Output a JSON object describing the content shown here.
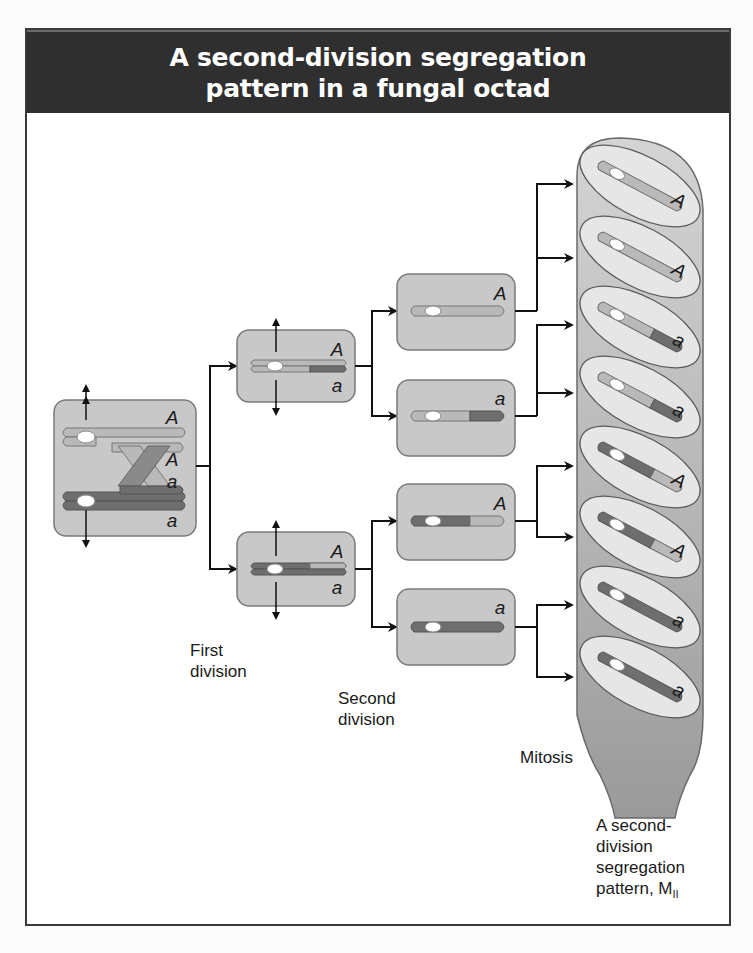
{
  "title": {
    "line1": "A second-division segregation",
    "line2": "pattern in a fungal octad"
  },
  "labels": {
    "first_division": [
      "First",
      "division"
    ],
    "second_division": [
      "Second",
      "division"
    ],
    "mitosis": "Mitosis",
    "result": [
      "A second-",
      "division",
      "segregation",
      "pattern, M"
    ],
    "result_subscript": "II"
  },
  "colors": {
    "title_bg": "#2f2f2f",
    "cell_fill": "#c8c8c8",
    "cell_stroke": "#7a7a7a",
    "light_chromatid": "#b9b9b9",
    "dark_chromatid": "#6e6e6e",
    "centromere": "#ffffff",
    "ascus_fill": "#aeaeae",
    "spore_fill": "#e6e6e6",
    "arrow": "#111111"
  },
  "meiosis_cell": {
    "alleles": [
      "A",
      "A",
      "a",
      "a"
    ]
  },
  "first_division_cells": [
    {
      "alleles": [
        "A",
        "a"
      ]
    },
    {
      "alleles": [
        "A",
        "a"
      ]
    }
  ],
  "second_division_cells": [
    {
      "allele": "A"
    },
    {
      "allele": "a"
    },
    {
      "allele": "A"
    },
    {
      "allele": "a"
    }
  ],
  "octad_spores": [
    {
      "allele": "A"
    },
    {
      "allele": "A"
    },
    {
      "allele": "a"
    },
    {
      "allele": "a"
    },
    {
      "allele": "A"
    },
    {
      "allele": "A"
    },
    {
      "allele": "a"
    },
    {
      "allele": "a"
    }
  ]
}
